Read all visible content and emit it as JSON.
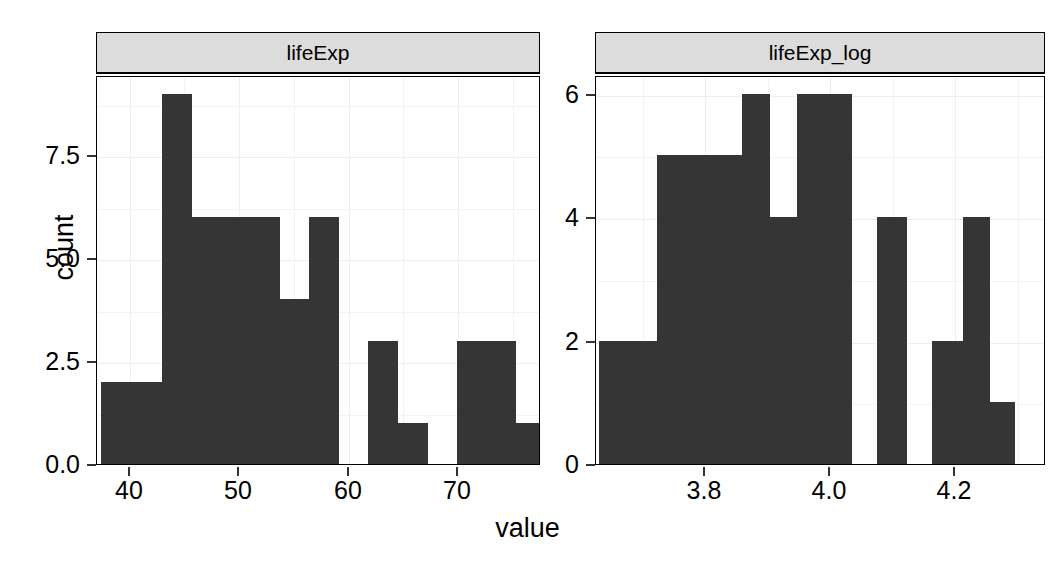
{
  "chart_data": {
    "type": "bar",
    "title": "",
    "xlabel": "value",
    "ylabel": "count",
    "layout": "facet-grid-1x2",
    "grid": true,
    "legend": null,
    "facets": [
      {
        "strip_label": "lifeExp",
        "xlim": [
          37.0,
          77.6
        ],
        "ylim": [
          0,
          9.45
        ],
        "x_ticks": [
          40,
          50,
          60,
          70
        ],
        "x_tick_labels": [
          "40",
          "50",
          "60",
          "70"
        ],
        "y_ticks": [
          0.0,
          2.5,
          5.0,
          7.5
        ],
        "y_tick_labels": [
          "0.0",
          "2.5",
          "5.0",
          "7.5"
        ],
        "bins": [
          {
            "x0": 37.4,
            "x1": 40.2,
            "count": 2
          },
          {
            "x0": 40.2,
            "x1": 42.9,
            "count": 2
          },
          {
            "x0": 42.9,
            "x1": 45.6,
            "count": 9
          },
          {
            "x0": 45.6,
            "x1": 48.3,
            "count": 6
          },
          {
            "x0": 48.3,
            "x1": 51.0,
            "count": 6
          },
          {
            "x0": 51.0,
            "x1": 53.7,
            "count": 6
          },
          {
            "x0": 53.7,
            "x1": 56.4,
            "count": 4
          },
          {
            "x0": 56.4,
            "x1": 59.1,
            "count": 6
          },
          {
            "x0": 59.1,
            "x1": 61.8,
            "count": 0
          },
          {
            "x0": 61.8,
            "x1": 64.5,
            "count": 3
          },
          {
            "x0": 64.5,
            "x1": 67.2,
            "count": 1
          },
          {
            "x0": 67.2,
            "x1": 69.9,
            "count": 0
          },
          {
            "x0": 69.9,
            "x1": 75.3,
            "count": 3
          },
          {
            "x0": 75.3,
            "x1": 77.6,
            "count": 1
          }
        ]
      },
      {
        "strip_label": "lifeExp_log",
        "xlim": [
          3.625,
          4.345
        ],
        "ylim": [
          0,
          6.3
        ],
        "x_ticks": [
          3.8,
          4.0,
          4.2
        ],
        "x_tick_labels": [
          "3.8",
          "4.0",
          "4.2"
        ],
        "y_ticks": [
          0,
          2,
          4,
          6
        ],
        "y_tick_labels": [
          "0",
          "2",
          "4",
          "6"
        ],
        "bins": [
          {
            "x0": 3.63,
            "x1": 3.722,
            "count": 2
          },
          {
            "x0": 3.722,
            "x1": 3.858,
            "count": 5
          },
          {
            "x0": 3.858,
            "x1": 3.902,
            "count": 6
          },
          {
            "x0": 3.902,
            "x1": 3.947,
            "count": 4
          },
          {
            "x0": 3.947,
            "x1": 4.035,
            "count": 6
          },
          {
            "x0": 4.035,
            "x1": 4.075,
            "count": 0
          },
          {
            "x0": 4.075,
            "x1": 4.123,
            "count": 4
          },
          {
            "x0": 4.123,
            "x1": 4.163,
            "count": 0
          },
          {
            "x0": 4.163,
            "x1": 4.212,
            "count": 2
          },
          {
            "x0": 4.212,
            "x1": 4.255,
            "count": 4
          },
          {
            "x0": 4.255,
            "x1": 4.295,
            "count": 1
          }
        ]
      }
    ]
  },
  "colors": {
    "bar_fill": "#353535",
    "strip_fill": "#dcdcdc",
    "panel_border": "#000000",
    "grid": "#f0f0f0",
    "background": "#ffffff"
  }
}
